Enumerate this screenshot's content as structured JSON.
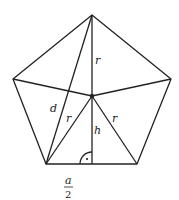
{
  "diagram": {
    "stroke_color": "#222222",
    "labels": {
      "r_top": "r",
      "r_left": "r",
      "r_right": "r",
      "d": "d",
      "h": "h",
      "half_a_num": "a",
      "half_a_den": "2"
    },
    "points": {
      "top": [
        92,
        15
      ],
      "left": [
        13,
        79
      ],
      "right": [
        171,
        79
      ],
      "bottom_left": [
        46,
        164
      ],
      "bottom_right": [
        137,
        164
      ],
      "center": [
        92,
        96
      ],
      "foot": [
        92,
        164
      ]
    }
  }
}
